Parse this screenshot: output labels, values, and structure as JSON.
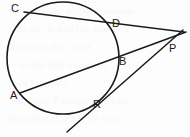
{
  "figure": {
    "width": 190,
    "height": 137,
    "background_color": "#fdfdfd",
    "stroke_color": "#1a1a1a",
    "label_color": "#1a1a1a"
  },
  "circle": {
    "name": "circle",
    "cx": 63,
    "cy": 58,
    "r": 56,
    "stroke_width": 1.6
  },
  "points": [
    {
      "id": "C",
      "label": "C",
      "on_figure_x": 26,
      "on_figure_y": 13,
      "label_x": 11,
      "label_y": 3,
      "role": "secant-far-endpoint"
    },
    {
      "id": "D",
      "label": "D",
      "on_figure_x": 110,
      "on_figure_y": 28,
      "label_x": 112,
      "label_y": 18,
      "role": "secant-near-endpoint"
    },
    {
      "id": "P",
      "label": "P",
      "on_figure_x": 168,
      "on_figure_y": 40,
      "label_x": 169,
      "label_y": 43,
      "role": "external-intersection"
    },
    {
      "id": "B",
      "label": "B",
      "on_figure_x": 117,
      "on_figure_y": 61,
      "label_x": 119,
      "label_y": 56,
      "role": "secant-near-endpoint"
    },
    {
      "id": "A",
      "label": "A",
      "on_figure_x": 22,
      "on_figure_y": 92,
      "label_x": 10,
      "label_y": 90,
      "role": "secant-far-endpoint"
    },
    {
      "id": "R",
      "label": "R",
      "on_figure_x": 88,
      "on_figure_y": 103,
      "label_x": 93,
      "label_y": 99,
      "role": "tangent-point"
    }
  ],
  "lines": [
    {
      "id": "secant-CP",
      "label": "C to P",
      "x1": 24,
      "y1": 12,
      "x2": 184,
      "y2": 32,
      "stroke_width": 1.5
    },
    {
      "id": "secant-AP",
      "label": "A to P",
      "x1": 20,
      "y1": 93,
      "x2": 186,
      "y2": 32,
      "stroke_width": 1.5
    },
    {
      "id": "tangent-RP",
      "label": "Tangent through R to P",
      "x1": 67,
      "y1": 132,
      "x2": 183,
      "y2": 30,
      "stroke_width": 1.5
    }
  ],
  "ghost_text": {
    "note": "faint show-through text from reverse of page",
    "lines": [
      "vertex of the angle is outside",
      "the circle and the sides",
      "intersect the circle",
      "secant and a tangent",
      "two tangents",
      "m angle P equals one half",
      "the difference of the arcs"
    ]
  }
}
